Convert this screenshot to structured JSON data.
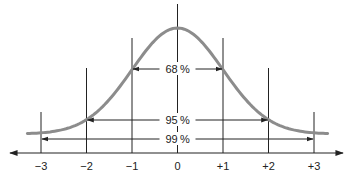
{
  "chart_data": {
    "type": "line",
    "title": "",
    "subtitle": "",
    "xlabel": "",
    "ylabel": "",
    "x_ticks": [
      "−3",
      "−2",
      "−1",
      "0",
      "+1",
      "+2",
      "+3"
    ],
    "x_values": [
      -3,
      -2,
      -1,
      0,
      1,
      2,
      3
    ],
    "xlim": [
      -3.8,
      3.8
    ],
    "grid": false,
    "legend": null,
    "series": [
      {
        "name": "normal density",
        "x": [
          -3.3,
          -3,
          -2.5,
          -2,
          -1.5,
          -1,
          -0.5,
          0,
          0.5,
          1,
          1.5,
          2,
          2.5,
          3,
          3.3
        ],
        "values": [
          0.0017,
          0.0044,
          0.0175,
          0.054,
          0.1295,
          0.242,
          0.352,
          0.399,
          0.352,
          0.242,
          0.1295,
          0.054,
          0.0175,
          0.0044,
          0.0017
        ]
      }
    ],
    "annotations": [
      {
        "label": "68 %",
        "range": [
          -1,
          1
        ],
        "percent": 68
      },
      {
        "label": "95 %",
        "range": [
          -2,
          2
        ],
        "percent": 95
      },
      {
        "label": "99 %",
        "range": [
          -3,
          3
        ],
        "percent": 99
      }
    ],
    "colors": {
      "curve": "#8c8c8c",
      "lines": "#222222",
      "text": "#222222"
    }
  }
}
